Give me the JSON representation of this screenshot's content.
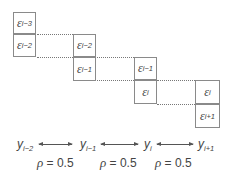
{
  "diagram": {
    "columns": [
      {
        "top": {
          "symbol": "ε",
          "sub": "i−3"
        },
        "bottom": {
          "symbol": "ε",
          "sub": "i−2"
        }
      },
      {
        "top": {
          "symbol": "ε",
          "sub": "i−2"
        },
        "bottom": {
          "symbol": "ε",
          "sub": "i−1"
        }
      },
      {
        "top": {
          "symbol": "ε",
          "sub": "i−1"
        },
        "bottom": {
          "symbol": "ε",
          "sub": "i"
        }
      },
      {
        "top": {
          "symbol": "ε",
          "sub": "i"
        },
        "bottom": {
          "symbol": "ε",
          "sub": "i+1"
        }
      }
    ],
    "y_labels": [
      {
        "symbol": "y",
        "sub": "i−2"
      },
      {
        "symbol": "y",
        "sub": "i−1"
      },
      {
        "symbol": "y",
        "sub": "i"
      },
      {
        "symbol": "y",
        "sub": "i+1"
      }
    ],
    "correlations": [
      {
        "symbol": "ρ",
        "text": " = 0.5"
      },
      {
        "symbol": "ρ",
        "text": " = 0.5"
      },
      {
        "symbol": "ρ",
        "text": " = 0.5"
      }
    ]
  }
}
